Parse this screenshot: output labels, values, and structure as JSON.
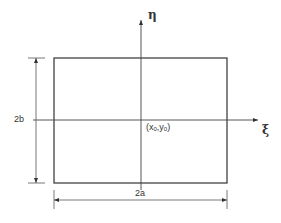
{
  "diagram": {
    "type": "rectangle-with-local-coordinate-axes",
    "rectangle": {
      "left": 54,
      "top": 58,
      "right": 227,
      "bottom": 183
    },
    "axes": {
      "vertical": {
        "label": "η",
        "name": "eta"
      },
      "horizontal": {
        "label": "ξ",
        "name": "xi"
      }
    },
    "center_label": {
      "open": "(",
      "x": "x",
      "x_sub": "0",
      "sep": ",",
      "y": "y",
      "y_sub": "0",
      "close": ")"
    },
    "dimensions": {
      "height_label": "2b",
      "width_label": "2a"
    },
    "colors": {
      "line": "#333333",
      "background": "#ffffff"
    }
  }
}
